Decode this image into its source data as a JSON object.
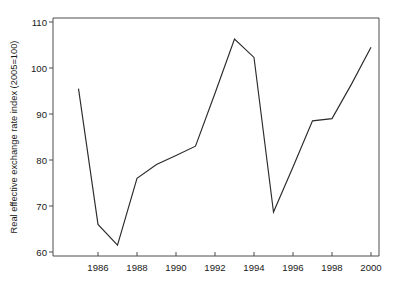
{
  "chart_data": {
    "type": "line",
    "title": "",
    "subtitle": "",
    "xlabel": "",
    "ylabel": "Real effective exchange rate index (2005=100)",
    "x": [
      1985,
      1986,
      1987,
      1988,
      1989,
      1990,
      1991,
      1992,
      1993,
      1994,
      1995,
      1996,
      1997,
      1998,
      1999,
      2000
    ],
    "values": [
      95.5,
      66.0,
      61.5,
      76.0,
      79.0,
      81.0,
      83.0,
      94.5,
      106.3,
      102.3,
      68.7,
      78.5,
      88.5,
      89.0,
      96.5,
      104.5
    ],
    "series": [
      {
        "name": "Real effective exchange rate index",
        "values": [
          95.5,
          66.0,
          61.5,
          76.0,
          79.0,
          81.0,
          83.0,
          94.5,
          106.3,
          102.3,
          68.7,
          78.5,
          88.5,
          89.0,
          96.5,
          104.5
        ]
      }
    ],
    "xlim": [
      1985,
      2000.8
    ],
    "ylim": [
      60,
      110
    ],
    "xticks": [
      1986,
      1988,
      1990,
      1992,
      1994,
      1996,
      1998,
      2000
    ],
    "xtick_labels": [
      "1986",
      "1988",
      "1990",
      "1992",
      "1994",
      "1996",
      "1998",
      "2000"
    ],
    "yticks": [
      60,
      70,
      80,
      90,
      100,
      110
    ],
    "ytick_labels": [
      "60",
      "70",
      "80",
      "90",
      "100",
      "110"
    ],
    "grid": false,
    "legend": null,
    "legend_position": "none",
    "line_color": "#2b2b2b",
    "axis_color": "#4d4d4d",
    "background_color": "#ffffff",
    "annotations": []
  }
}
